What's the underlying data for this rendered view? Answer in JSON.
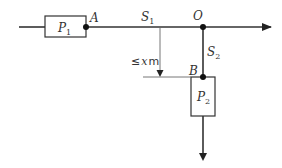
{
  "diagram": {
    "type": "road-junction-schematic",
    "colors": {
      "line": "#222222",
      "thin_line": "#555555",
      "text": "#333333",
      "background": "#ffffff"
    },
    "nodes": {
      "A": {
        "label": "A"
      },
      "O": {
        "label": "O"
      },
      "B": {
        "label": "B"
      }
    },
    "boxes": {
      "P1": {
        "main": "P",
        "sub": "1"
      },
      "P2": {
        "main": "P",
        "sub": "2"
      }
    },
    "segments": {
      "S1": {
        "main": "S",
        "sub": "1"
      },
      "S2": {
        "main": "S",
        "sub": "2"
      }
    },
    "dimension": {
      "prefix": "≤",
      "var": "x",
      "unit": "m"
    }
  }
}
